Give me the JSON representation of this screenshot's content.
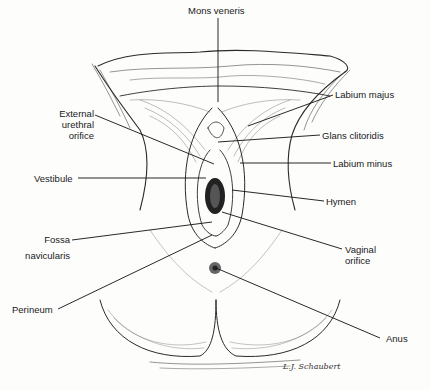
{
  "figure": {
    "signature": "L.J. Schaubert",
    "ink_color": "#1a1a1a",
    "background_color": "#fdfdfc"
  },
  "labels": {
    "mons_veneris": "Mons veneris",
    "labium_majus": "Labium majus",
    "external_urethral_orifice": [
      "External",
      "urethral",
      "orifice"
    ],
    "glans_clitoridis": "Glans clitoridis",
    "labium_minus": "Labium minus",
    "vestibule": "Vestibule",
    "hymen": "Hymen",
    "fossa_navicularis": [
      "Fossa",
      "navicularis"
    ],
    "vaginal_orifice": [
      "Vaginal",
      "orifice"
    ],
    "perineum": "Perineum",
    "anus": "Anus"
  }
}
